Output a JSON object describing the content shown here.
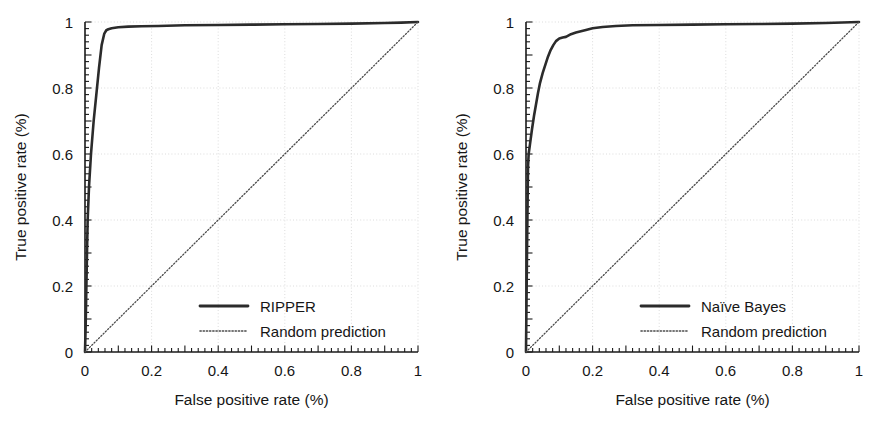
{
  "figure": {
    "background": "#ffffff",
    "ink": "#1a1a1a",
    "grid_color": "#d8d8d8",
    "panels": [
      "left",
      "right"
    ]
  },
  "chart_data": [
    {
      "type": "line",
      "panel": "left",
      "title": "",
      "xlabel": "False positive rate (%)",
      "ylabel": "True positive rate (%)",
      "xlim": [
        0,
        1
      ],
      "ylim": [
        0,
        1
      ],
      "xticks": [
        0,
        0.2,
        0.4,
        0.6,
        0.8,
        1
      ],
      "xticklabels": [
        "0",
        "0.2",
        "0.4",
        "0.6",
        "0.8",
        "1"
      ],
      "yticks": [
        0,
        0.2,
        0.4,
        0.6,
        0.8,
        1
      ],
      "yticklabels": [
        "0",
        "0.2",
        "0.4",
        "0.6",
        "0.8",
        "1"
      ],
      "grid": true,
      "minor_ticks": true,
      "legend_position": "lower right",
      "series": [
        {
          "name": "RIPPER",
          "style": "solid",
          "color": "#2b2b2b",
          "x": [
            0.0,
            0.002,
            0.004,
            0.006,
            0.008,
            0.012,
            0.018,
            0.026,
            0.034,
            0.042,
            0.05,
            0.058,
            0.064,
            0.07,
            0.08,
            0.1,
            0.13,
            0.17,
            0.22,
            0.3,
            0.4,
            0.5,
            0.6,
            0.7,
            0.8,
            0.9,
            0.95,
            1.0
          ],
          "y": [
            0.0,
            0.08,
            0.19,
            0.3,
            0.4,
            0.5,
            0.6,
            0.7,
            0.78,
            0.86,
            0.93,
            0.965,
            0.975,
            0.978,
            0.981,
            0.984,
            0.986,
            0.987,
            0.988,
            0.99,
            0.991,
            0.992,
            0.993,
            0.994,
            0.995,
            0.997,
            0.998,
            1.0
          ]
        },
        {
          "name": "Random prediction",
          "style": "dotted",
          "color": "#4a4a4a",
          "x": [
            0,
            1
          ],
          "y": [
            0,
            1
          ]
        }
      ],
      "legend": [
        {
          "label": "RIPPER",
          "style": "solid"
        },
        {
          "label": "Random prediction",
          "style": "dotted"
        }
      ]
    },
    {
      "type": "line",
      "panel": "right",
      "title": "",
      "xlabel": "False positive rate (%)",
      "ylabel": "True positive rate (%)",
      "xlim": [
        0,
        1
      ],
      "ylim": [
        0,
        1
      ],
      "xticks": [
        0,
        0.2,
        0.4,
        0.6,
        0.8,
        1
      ],
      "xticklabels": [
        "0",
        "0.2",
        "0.4",
        "0.6",
        "0.8",
        "1"
      ],
      "yticks": [
        0,
        0.2,
        0.4,
        0.6,
        0.8,
        1
      ],
      "yticklabels": [
        "0",
        "0.2",
        "0.4",
        "0.6",
        "0.8",
        "1"
      ],
      "grid": true,
      "minor_ticks": true,
      "legend_position": "lower right",
      "series": [
        {
          "name": "Naïve Bayes",
          "style": "solid",
          "color": "#2b2b2b",
          "x": [
            0.0,
            0.003,
            0.006,
            0.008,
            0.012,
            0.018,
            0.024,
            0.03,
            0.036,
            0.042,
            0.05,
            0.058,
            0.066,
            0.074,
            0.082,
            0.09,
            0.1,
            0.11,
            0.12,
            0.135,
            0.15,
            0.165,
            0.18,
            0.2,
            0.23,
            0.27,
            0.32,
            0.4,
            0.5,
            0.6,
            0.7,
            0.8,
            0.9,
            1.0
          ],
          "y": [
            0.0,
            0.3,
            0.56,
            0.6,
            0.63,
            0.675,
            0.715,
            0.75,
            0.785,
            0.815,
            0.845,
            0.87,
            0.895,
            0.915,
            0.93,
            0.942,
            0.95,
            0.953,
            0.955,
            0.963,
            0.968,
            0.972,
            0.976,
            0.981,
            0.985,
            0.988,
            0.99,
            0.991,
            0.992,
            0.993,
            0.994,
            0.995,
            0.997,
            1.0
          ]
        },
        {
          "name": "Random prediction",
          "style": "dotted",
          "color": "#4a4a4a",
          "x": [
            0,
            1
          ],
          "y": [
            0,
            1
          ]
        }
      ],
      "legend": [
        {
          "label": "Naïve Bayes",
          "style": "solid"
        },
        {
          "label": "Random prediction",
          "style": "dotted"
        }
      ]
    }
  ]
}
